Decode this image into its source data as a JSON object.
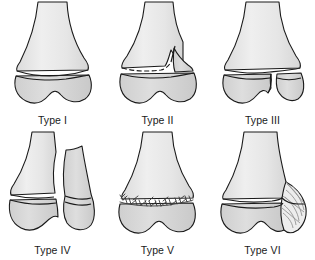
{
  "figure": {
    "background_color": "#ffffff",
    "grid": {
      "rows": 2,
      "columns": 3
    }
  },
  "palette": {
    "outline": "#1a1a1a",
    "shaft_fill": "#e8e8e8",
    "epiphysis_fill": "#d2d2d2",
    "physis_gap": "#ffffff",
    "hatch_line": "#9a9a9a",
    "label_color": "#1a1a1a"
  },
  "panels": [
    {
      "id": "type-1",
      "label": "Type I",
      "numeral": "I",
      "row": 0,
      "column": 0,
      "fracture": "transverse separation through the physis",
      "fragment": "none"
    },
    {
      "id": "type-2",
      "label": "Type II",
      "numeral": "II",
      "row": 0,
      "column": 1,
      "fracture": "physeal separation with triangular metaphyseal fragment",
      "fragment": "metaphyseal wedge"
    },
    {
      "id": "type-3",
      "label": "Type III",
      "numeral": "III",
      "row": 0,
      "column": 2,
      "fracture": "physeal separation with vertical epiphyseal split",
      "fragment": "epiphyseal fragment"
    },
    {
      "id": "type-4",
      "label": "Type IV",
      "numeral": "IV",
      "row": 1,
      "column": 0,
      "fracture": "vertical split crossing metaphysis, physis and epiphysis",
      "fragment": "metaphyseal and epiphyseal fragment"
    },
    {
      "id": "type-5",
      "label": "Type V",
      "numeral": "V",
      "row": 1,
      "column": 1,
      "fracture": "crush compression of the physis",
      "fragment": "comminuted physeal crush"
    },
    {
      "id": "type-6",
      "label": "Type VI",
      "numeral": "VI",
      "row": 1,
      "column": 2,
      "fracture": "peripheral injury to the perichondral ring",
      "fragment": "peripheral defect with hatching"
    }
  ]
}
